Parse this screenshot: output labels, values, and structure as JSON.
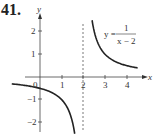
{
  "problem_number": "41.",
  "chart_data": {
    "type": "line",
    "title": "",
    "equation": {
      "lhs": "y =",
      "numerator": "1",
      "denominator": "x − 2"
    },
    "xlabel": "x",
    "ylabel": "y",
    "xlim": [
      -1.3,
      4.8
    ],
    "ylim": [
      -2.6,
      2.8
    ],
    "x_ticks": [
      "0",
      "1",
      "2",
      "3",
      "4"
    ],
    "y_ticks": [
      "2",
      "1",
      "−1",
      "−2"
    ],
    "asymptote": {
      "type": "vertical",
      "x": 2,
      "style": "dashed"
    },
    "grid": false,
    "series": [
      {
        "name": "y = 1/(x-2), left branch",
        "x": [
          -1.3,
          -1,
          -0.5,
          0,
          0.5,
          1,
          1.3,
          1.5,
          1.6
        ],
        "y": [
          -0.3,
          -0.33,
          -0.4,
          -0.5,
          -0.67,
          -1,
          -1.43,
          -2,
          -2.5
        ]
      },
      {
        "name": "y = 1/(x-2), right branch",
        "x": [
          2.4,
          2.5,
          2.75,
          3,
          3.5,
          4,
          4.5
        ],
        "y": [
          2.5,
          2,
          1.33,
          1,
          0.67,
          0.5,
          0.4
        ]
      }
    ]
  }
}
